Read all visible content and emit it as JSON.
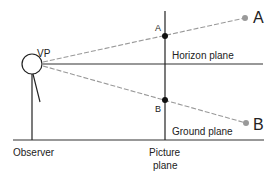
{
  "diagram": {
    "type": "perspective-projection",
    "labels": {
      "vp": "VP",
      "point_a_far": "A",
      "point_a_proj": "A",
      "point_b_far": "B",
      "point_b_proj": "B",
      "horizon": "Horizon plane",
      "ground": "Ground plane",
      "observer": "Observer",
      "picture_line1": "Picture",
      "picture_line2": "plane"
    },
    "colors": {
      "line": "#222222",
      "sight_line": "#999999",
      "endpoint": "#999999",
      "projection_dot": "#111111"
    }
  }
}
